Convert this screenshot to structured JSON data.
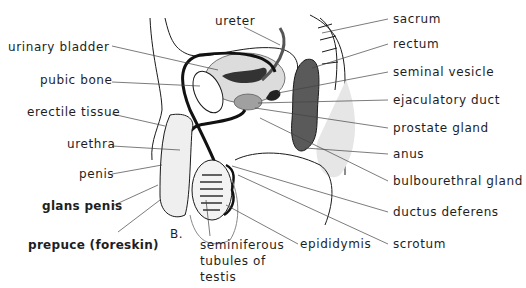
{
  "figure": {
    "panel_letter": "B."
  },
  "labels_left": [
    {
      "id": "urinary-bladder",
      "text": "urinary bladder"
    },
    {
      "id": "pubic-bone",
      "text": "pubic bone"
    },
    {
      "id": "erectile-tissue",
      "text": "erectile tissue"
    },
    {
      "id": "urethra",
      "text": "urethra"
    },
    {
      "id": "penis",
      "text": "penis"
    },
    {
      "id": "glans-penis",
      "text": "glans penis"
    },
    {
      "id": "prepuce",
      "text": "prepuce (foreskin)"
    }
  ],
  "labels_right": [
    {
      "id": "sacrum",
      "text": "sacrum"
    },
    {
      "id": "rectum",
      "text": "rectum"
    },
    {
      "id": "seminal-vesicle",
      "text": "seminal vesicle"
    },
    {
      "id": "ejaculatory-duct",
      "text": "ejaculatory duct"
    },
    {
      "id": "prostate-gland",
      "text": "prostate gland"
    },
    {
      "id": "anus",
      "text": "anus"
    },
    {
      "id": "bulbourethral-gland",
      "text": "bulbourethral gland"
    },
    {
      "id": "ductus-deferens",
      "text": "ductus deferens"
    },
    {
      "id": "scrotum",
      "text": "scrotum"
    }
  ],
  "labels_other": {
    "ureter": "ureter",
    "epididymis": "epididymis",
    "seminiferous_line1": "seminiferous",
    "seminiferous_line2": "tubules of",
    "seminiferous_line3": "testis"
  },
  "colors": {
    "line": "#1a1a1a",
    "leader": "#444444",
    "organ_light": "#d9d9d9",
    "organ_mid": "#a9a9a9",
    "organ_dark": "#3a3a3a"
  }
}
